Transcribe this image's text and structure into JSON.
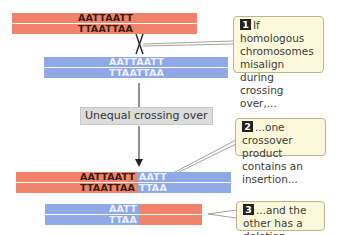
{
  "colors": {
    "chromosome_a": "#f2836b",
    "chromosome_b": "#8fa8e6",
    "callout_bg": "#fbf8dc",
    "label_bg": "#dcdcdc"
  },
  "top_pair": {
    "red": {
      "strand1": "AATTAATT",
      "strand2": "TTAATTAA"
    },
    "blue": {
      "strand1": "AATTAATT",
      "strand2": "TTAATTAA"
    }
  },
  "process_label": "Unequal crossing over",
  "products": {
    "insertion": {
      "red_part": {
        "strand1": "AATTAATT",
        "strand2": "TTAATTAA"
      },
      "blue_part": {
        "strand1": "AATT",
        "strand2": "TTAA"
      }
    },
    "deletion": {
      "blue_part": {
        "strand1": "AATT",
        "strand2": "TTAA"
      }
    }
  },
  "callouts": [
    {
      "number": "1",
      "text": "If homologous chromosomes misalign during crossing over,..."
    },
    {
      "number": "2",
      "text": "...one crossover product contains an insertion..."
    },
    {
      "number": "3",
      "text": "...and the other has a deletion."
    }
  ]
}
